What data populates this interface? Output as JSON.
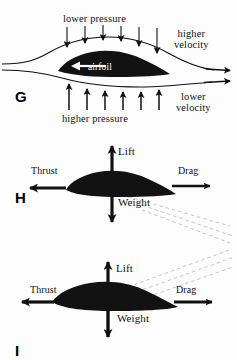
{
  "figure": {
    "background_color": "#fdfdfd",
    "ink_color": "#121212",
    "ghost_line_color": "#b9b9b9"
  },
  "panels": [
    {
      "letter": "G",
      "name": "pressure-and-velocity-around-airfoil",
      "labels": {
        "lower_pressure": "lower pressure",
        "higher_pressure": "higher pressure",
        "higher_velocity_line1": "higher",
        "higher_velocity_line2": "velocity",
        "lower_velocity_line1": "lower",
        "lower_velocity_line2": "velocity",
        "airfoil": "airfoil"
      },
      "arrow_counts": {
        "downward_pressure_arrows": 6,
        "upward_pressure_arrows": 6,
        "streamline_flow_arrows": 2
      }
    },
    {
      "letter": "H",
      "name": "level-flight-forces",
      "labels": {
        "lift": "Lift",
        "thrust": "Thrust",
        "drag": "Drag",
        "weight": "Weight"
      },
      "arrows": [
        {
          "name": "lift-arrow",
          "direction": "up"
        },
        {
          "name": "thrust-arrow",
          "direction": "left"
        },
        {
          "name": "drag-arrow",
          "direction": "right"
        },
        {
          "name": "weight-arrow",
          "direction": "down"
        }
      ],
      "ghost_lines": {
        "count": 3,
        "slope": "descending-right"
      }
    },
    {
      "letter": "I",
      "name": "climbing-flight-forces",
      "labels": {
        "lift": "Lift",
        "thrust": "Thrust",
        "drag": "Drag",
        "weight": "Weight"
      },
      "arrows": [
        {
          "name": "lift-arrow",
          "direction": "up"
        },
        {
          "name": "thrust-arrow",
          "direction": "left"
        },
        {
          "name": "drag-arrow",
          "direction": "right"
        },
        {
          "name": "weight-arrow",
          "direction": "down"
        }
      ],
      "ghost_lines": {
        "count": 3,
        "slope": "ascending-right"
      }
    }
  ]
}
